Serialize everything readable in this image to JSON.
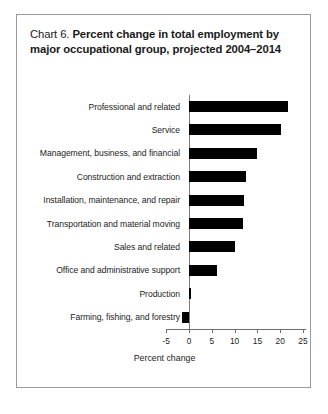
{
  "chart": {
    "title_prefix": "Chart 6.",
    "title_line1": "Percent change in total employment by",
    "title_line2": "major occupational group, projected 2004–2014"
  },
  "chart_data": {
    "type": "bar",
    "orientation": "horizontal",
    "title": "Chart 6. Percent change in total employment by major occupational group, projected 2004–2014",
    "xlabel": "Percent change",
    "ylabel": "",
    "xlim": [
      -5,
      25
    ],
    "xticks": [
      -5,
      0,
      5,
      10,
      15,
      20,
      25
    ],
    "xtick_labels": [
      "-5",
      "0",
      "5",
      "10",
      "15",
      "20",
      "25"
    ],
    "grid": false,
    "legend": false,
    "bar_color": "#000000",
    "categories": [
      "Professional and related",
      "Service",
      "Management, business, and financial",
      "Construction and extraction",
      "Installation, maintenance, and repair",
      "Transportation and material moving",
      "Sales and related",
      "Office and administrative support",
      "Production",
      "Farming, fishing, and forestry"
    ],
    "values": [
      21.7,
      20.2,
      14.9,
      12.5,
      12.1,
      11.8,
      10.0,
      6.2,
      0.5,
      -1.5
    ]
  }
}
